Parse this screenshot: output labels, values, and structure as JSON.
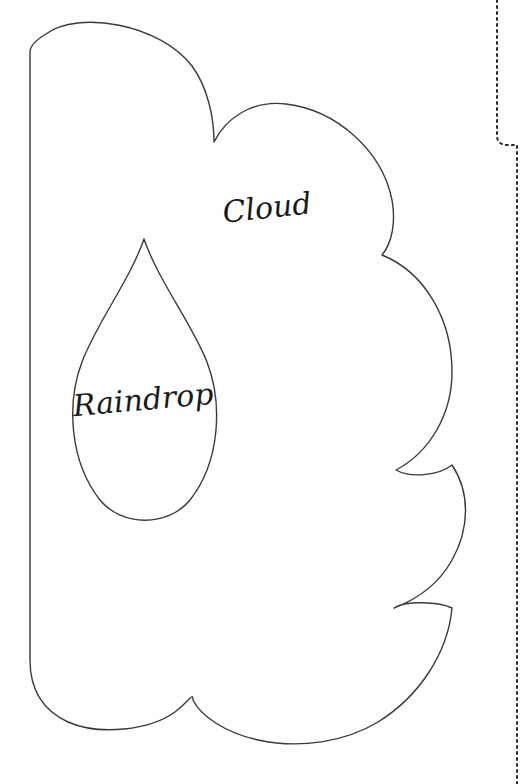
{
  "document": {
    "type": "craft-pattern-template",
    "title": "Cloud and Raindrop Pattern Template",
    "background_color": "#ffffff",
    "width": 527,
    "height": 784
  },
  "style": {
    "outline_color": "#3a3a3a",
    "outline_width": 1.4,
    "guide_color": "#2b2b2b",
    "label_color": "#1a1a1a",
    "label_font_size": 30,
    "dotted_dash_pattern": "2 4"
  },
  "shapes": {
    "cloud": {
      "name": "Cloud",
      "label": "Cloud",
      "label_x": 268,
      "label_y": 218,
      "label_rotation": -6,
      "stroke": "#3a3a3a",
      "fill": "none",
      "path": "M 30,52 L 30,660 C 30,690 42,710 68,722 C 100,736 150,730 175,712 C 190,700 193,692 193,700 C 200,715 225,733 258,740 C 300,749 345,742 378,722 C 420,696 448,652 452,608 C 440,602 406,600 394,608 C 420,598 440,582 452,560 C 470,528 470,492 452,465 C 438,476 410,478 396,470 C 430,452 452,414 452,372 C 452,318 424,272 382,255 C 392,243 396,222 392,200 C 382,150 336,110 286,104 C 252,100 226,118 214,142 C 214,118 208,88 192,66 C 160,24 78,10 46,34 C 36,40 30,46 30,52 Z"
    },
    "raindrop": {
      "name": "Raindrop",
      "label": "Raindrop",
      "label_x": 144,
      "label_y": 410,
      "label_rotation": -5,
      "stroke": "#3a3a3a",
      "fill": "none",
      "path": "M 144,239 C 130,280 96,324 82,362 C 66,404 70,462 100,500 C 122,527 168,527 190,500 C 220,462 223,404 207,362 C 192,324 158,280 144,239 Z"
    }
  },
  "guides": {
    "fold_line": {
      "name": "fold-guide-line",
      "stroke": "#2b2b2b",
      "dash": "2 4",
      "width": 2,
      "path": "M 497,0 L 497,136 C 497,142 501,145 508,145 L 517,145 L 517,784"
    }
  },
  "labels": [
    {
      "id": "cloud",
      "text": "Cloud"
    },
    {
      "id": "raindrop",
      "text": "Raindrop"
    }
  ]
}
